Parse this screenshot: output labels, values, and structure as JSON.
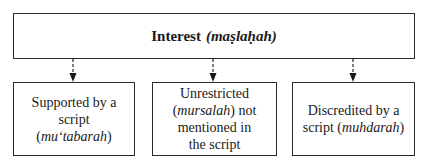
{
  "root": {
    "title": "Interest",
    "term": "(maṣlaḥah)"
  },
  "children": [
    {
      "line1": "Supported by a",
      "pre": "script (",
      "term": "mu‘tabarah",
      "post": ")"
    },
    {
      "line1": "Unrestricted",
      "pre": "(",
      "term": "mursalah",
      "post": ") not",
      "line3": "mentioned in",
      "line4": "the script"
    },
    {
      "line1": "Discredited by a",
      "pre": "script (",
      "term": "muhdarah",
      "post": ")"
    }
  ],
  "colors": {
    "border": "#2a2a2a",
    "text": "#1a1a1a",
    "background": "#ffffff"
  }
}
